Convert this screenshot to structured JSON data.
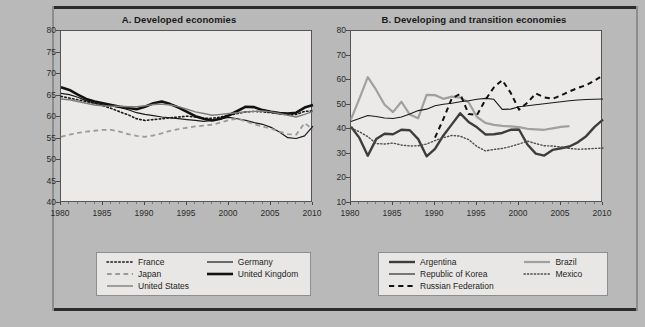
{
  "figure": {
    "background_color": "#b9b9b9",
    "plot_background_color": "#eceae8"
  },
  "panels": [
    {
      "id": "panel-a",
      "title": "A. Developed economies",
      "legend": {
        "items": [
          {
            "label": "France",
            "style": "dotted",
            "color": "#1a1a1a",
            "width": 1.6
          },
          {
            "label": "Germany",
            "style": "solid",
            "color": "#1a1a1a",
            "width": 1.2
          },
          {
            "label": "Japan",
            "style": "dashed",
            "color": "#9a9a9a",
            "width": 1.8
          },
          {
            "label": "United Kingdom",
            "style": "solid",
            "color": "#111111",
            "width": 2.6
          },
          {
            "label": "United States",
            "style": "solid",
            "color": "#7d7d7d",
            "width": 1.4
          }
        ]
      }
    },
    {
      "id": "panel-b",
      "title": "B. Developing and transition economies",
      "legend": {
        "items": [
          {
            "label": "Argentina",
            "style": "solid",
            "color": "#3d3d3d",
            "width": 2.4
          },
          {
            "label": "Brazil",
            "style": "solid",
            "color": "#a0a0a0",
            "width": 2.2
          },
          {
            "label": "Republic of Korea",
            "style": "solid",
            "color": "#1a1a1a",
            "width": 1.1
          },
          {
            "label": "Mexico",
            "style": "dotted",
            "color": "#4f4f4f",
            "width": 1.4
          },
          {
            "label": "Russian Federation",
            "style": "dashed",
            "color": "#111111",
            "width": 2.0
          }
        ]
      }
    }
  ],
  "chart_data": [
    {
      "id": "panel-a",
      "type": "line",
      "title": "A. Developed economies",
      "xlabel": "",
      "ylabel": "",
      "xlim": [
        1980,
        2010
      ],
      "ylim": [
        40,
        80
      ],
      "yticks": [
        40,
        45,
        50,
        55,
        60,
        65,
        70,
        75,
        80
      ],
      "xticks": [
        1980,
        1985,
        1990,
        1995,
        2000,
        2005,
        2010
      ],
      "grid": false,
      "legend_position": "below",
      "x": [
        1980,
        1981,
        1982,
        1983,
        1984,
        1985,
        1986,
        1987,
        1988,
        1989,
        1990,
        1991,
        1992,
        1993,
        1994,
        1995,
        1996,
        1997,
        1998,
        1999,
        2000,
        2001,
        2002,
        2003,
        2004,
        2005,
        2006,
        2007,
        2008,
        2009,
        2010
      ],
      "series": [
        {
          "name": "France",
          "style": "dotted",
          "color": "#1a1a1a",
          "values": [
            64.8,
            64.4,
            64.0,
            63.6,
            63.2,
            62.6,
            62.0,
            61.2,
            60.5,
            59.6,
            59.2,
            59.4,
            59.6,
            59.8,
            60.0,
            60.2,
            60.0,
            59.7,
            59.7,
            60.0,
            60.4,
            60.8,
            61.2,
            61.3,
            61.2,
            61.0,
            60.8,
            60.5,
            60.6,
            61.3,
            61.4
          ]
        },
        {
          "name": "Germany",
          "style": "solid",
          "color": "#1a1a1a",
          "values": [
            65.5,
            65.2,
            64.6,
            63.8,
            63.2,
            62.8,
            62.6,
            62.2,
            61.7,
            61.0,
            60.6,
            60.3,
            60.0,
            59.8,
            59.6,
            59.4,
            59.2,
            59.0,
            59.2,
            59.6,
            59.9,
            59.6,
            59.2,
            58.7,
            58.3,
            57.6,
            56.5,
            55.2,
            55.0,
            55.6,
            57.9
          ]
        },
        {
          "name": "Japan",
          "style": "dashed",
          "color": "#9a9a9a",
          "values": [
            55.4,
            55.9,
            56.3,
            56.6,
            56.8,
            57.0,
            57.0,
            56.6,
            56.0,
            55.6,
            55.4,
            55.7,
            56.2,
            56.8,
            57.2,
            57.5,
            57.8,
            58.0,
            58.2,
            58.7,
            59.3,
            59.6,
            59.0,
            58.3,
            57.8,
            57.3,
            56.6,
            56.0,
            55.9,
            58.6,
            57.1
          ]
        },
        {
          "name": "United Kingdom",
          "style": "solid",
          "color": "#111111",
          "values": [
            66.9,
            66.3,
            65.2,
            64.2,
            63.6,
            63.2,
            62.8,
            62.4,
            62.1,
            61.8,
            62.4,
            63.2,
            63.6,
            63.0,
            62.2,
            61.2,
            60.2,
            59.6,
            59.2,
            59.6,
            60.4,
            61.4,
            62.4,
            62.3,
            61.6,
            61.2,
            60.9,
            60.8,
            61.0,
            62.2,
            62.8
          ]
        },
        {
          "name": "United States",
          "style": "solid",
          "color": "#7d7d7d",
          "values": [
            64.2,
            64.0,
            63.6,
            63.2,
            62.8,
            62.6,
            62.5,
            62.5,
            62.4,
            62.4,
            62.6,
            62.9,
            63.0,
            62.8,
            62.4,
            61.8,
            61.2,
            60.8,
            60.4,
            60.6,
            60.8,
            61.0,
            61.2,
            61.3,
            61.4,
            61.2,
            60.8,
            60.4,
            60.0,
            60.6,
            61.3
          ]
        }
      ]
    },
    {
      "id": "panel-b",
      "type": "line",
      "title": "B. Developing and transition economies",
      "xlabel": "",
      "ylabel": "",
      "xlim": [
        1980,
        2010
      ],
      "ylim": [
        10,
        80
      ],
      "yticks": [
        10,
        20,
        30,
        40,
        50,
        60,
        70,
        80
      ],
      "xticks": [
        1980,
        1985,
        1990,
        1995,
        2000,
        2005,
        2010
      ],
      "grid": false,
      "legend_position": "below",
      "x": [
        1980,
        1981,
        1982,
        1983,
        1984,
        1985,
        1986,
        1987,
        1988,
        1989,
        1990,
        1991,
        1992,
        1993,
        1994,
        1995,
        1996,
        1997,
        1998,
        1999,
        2000,
        2001,
        2002,
        2003,
        2004,
        2005,
        2006,
        2007,
        2008,
        2009,
        2010
      ],
      "series": [
        {
          "name": "Argentina",
          "style": "solid",
          "color": "#3d3d3d",
          "values": [
            41.0,
            36.5,
            29.2,
            36.0,
            38.2,
            38.0,
            39.8,
            39.6,
            36.0,
            29.0,
            32.0,
            37.5,
            42.0,
            46.5,
            43.0,
            40.8,
            37.9,
            38.0,
            38.5,
            39.8,
            39.9,
            33.8,
            30.1,
            29.3,
            31.6,
            32.3,
            33.0,
            34.7,
            37.2,
            41.0,
            43.9
          ]
        },
        {
          "name": "Brazil",
          "style": "solid",
          "color": "#a0a0a0",
          "values": [
            44.0,
            52.5,
            61.2,
            56.0,
            50.0,
            47.0,
            51.2,
            46.0,
            44.5,
            54.0,
            53.9,
            52.4,
            53.3,
            52.9,
            51.0,
            45.0,
            42.6,
            41.8,
            41.4,
            41.2,
            40.9,
            40.2,
            40.0,
            39.8,
            40.4,
            41.0,
            41.3,
            null,
            null,
            null,
            null
          ]
        },
        {
          "name": "Republic of Korea",
          "style": "solid",
          "color": "#1a1a1a",
          "values": [
            43.2,
            44.4,
            45.6,
            45.2,
            44.6,
            44.4,
            45.0,
            46.2,
            47.6,
            48.2,
            49.6,
            50.2,
            50.6,
            51.2,
            51.6,
            52.2,
            52.6,
            52.2,
            48.1,
            48.2,
            49.2,
            49.6,
            50.0,
            50.4,
            50.8,
            51.2,
            51.6,
            51.9,
            52.1,
            52.2,
            52.3
          ]
        },
        {
          "name": "Mexico",
          "style": "dotted",
          "color": "#4f4f4f",
          "values": [
            40.5,
            39.0,
            37.0,
            34.2,
            34.0,
            34.4,
            33.6,
            33.2,
            33.3,
            34.0,
            35.4,
            36.6,
            37.5,
            37.2,
            35.8,
            33.0,
            31.2,
            31.8,
            32.2,
            33.0,
            34.0,
            35.2,
            34.2,
            33.3,
            33.2,
            32.8,
            32.2,
            31.9,
            32.0,
            32.2,
            32.4
          ]
        },
        {
          "name": "Russian Federation",
          "style": "dashed",
          "color": "#111111",
          "values": [
            null,
            null,
            null,
            null,
            null,
            null,
            null,
            null,
            null,
            null,
            36.6,
            44.2,
            52.6,
            54.4,
            46.2,
            45.8,
            52.0,
            57.0,
            60.0,
            54.9,
            48.0,
            50.8,
            54.6,
            53.0,
            52.4,
            53.8,
            55.4,
            56.8,
            58.0,
            59.8,
            62.0
          ]
        }
      ]
    }
  ]
}
